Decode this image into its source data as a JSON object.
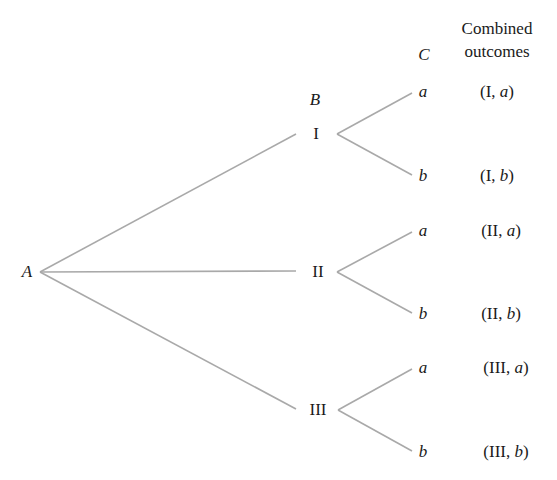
{
  "diagram": {
    "type": "tree",
    "header": {
      "stage_c": "C",
      "combined_line1": "Combined",
      "combined_line2": "outcomes"
    },
    "root": {
      "label": "A"
    },
    "stage_b_label": "B",
    "line_color": "#a9a9a9",
    "nodes_b": [
      {
        "label": "I",
        "children": [
          "a",
          "b"
        ],
        "outcomes": [
          "(I, a)",
          "(I, b)"
        ]
      },
      {
        "label": "II",
        "children": [
          "a",
          "b"
        ],
        "outcomes": [
          "(II, a)",
          "(II, b)"
        ]
      },
      {
        "label": "III",
        "children": [
          "a",
          "b"
        ],
        "outcomes": [
          "(III, a)",
          "(III, b)"
        ]
      }
    ],
    "outcome_parts": [
      [
        "I",
        "a"
      ],
      [
        "I",
        "b"
      ],
      [
        "II",
        "a"
      ],
      [
        "II",
        "b"
      ],
      [
        "III",
        "a"
      ],
      [
        "III",
        "b"
      ]
    ]
  }
}
